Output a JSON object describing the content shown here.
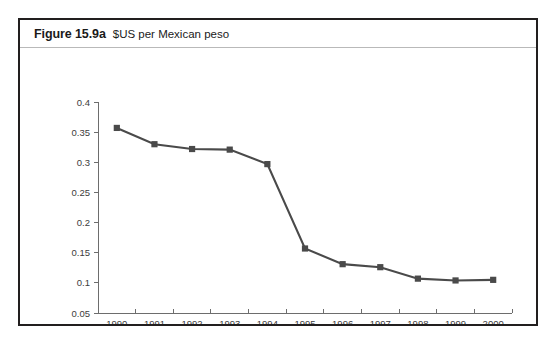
{
  "figure": {
    "number": "Figure 15.9a",
    "caption": "$US per Mexican peso"
  },
  "artifact": {
    "reverse_page_bleed": "Figure 15.9b Mexican pesos"
  },
  "colors": {
    "series": "#4a4a4a",
    "axis": "#6d6d6d",
    "frame": "#221f1f",
    "header_rule": "#b9b9b9",
    "text": "#1a1a1a"
  },
  "chart_data": {
    "type": "line",
    "title": "$US per Mexican peso",
    "xlabel": "",
    "ylabel": "",
    "categories": [
      "1990",
      "1991",
      "1992",
      "1993",
      "1994",
      "1995",
      "1996",
      "1997",
      "1998",
      "1999",
      "2000"
    ],
    "values": [
      0.357,
      0.33,
      0.322,
      0.321,
      0.297,
      0.157,
      0.131,
      0.126,
      0.107,
      0.104,
      0.105
    ],
    "ylim": [
      0.05,
      0.4
    ],
    "ytick_step": 0.05,
    "ytick_labels": [
      "0.4",
      "0.35",
      "0.3",
      "0.25",
      "0.2",
      "0.15",
      "0.1",
      "0.05"
    ],
    "grid": false,
    "legend": "none",
    "marker": "square"
  }
}
